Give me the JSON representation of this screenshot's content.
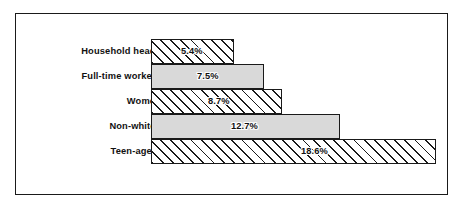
{
  "chart_data": {
    "type": "bar",
    "orientation": "horizontal",
    "title": "",
    "subtitle": "",
    "xlabel": "",
    "ylabel": "",
    "grid": false,
    "legend": null,
    "axis_visible": false,
    "value_suffix": "%",
    "xlim": [
      0,
      18.6
    ],
    "categories": [
      "Household heads",
      "Full-time workers",
      "Women",
      "Non-whites",
      "Teen-agers"
    ],
    "values": [
      5.4,
      12.7,
      8.7,
      12.7,
      18.6
    ],
    "bars": [
      {
        "label": "Household heads",
        "value": 5.4,
        "value_label": "5.4%",
        "fill": "hatched",
        "bar_width_px": 83,
        "value_label_offset_px": 30
      },
      {
        "label": "Full-time workers",
        "value": 7.5,
        "value_label": "7.5%",
        "fill": "solid",
        "bar_width_px": 113,
        "value_label_offset_px": 46
      },
      {
        "label": "Women",
        "value": 8.7,
        "value_label": "8.7%",
        "fill": "hatched",
        "bar_width_px": 131,
        "value_label_offset_px": 57
      },
      {
        "label": "Non-whites",
        "value": 12.7,
        "value_label": "12.7%",
        "fill": "solid",
        "bar_width_px": 189,
        "value_label_offset_px": 80
      },
      {
        "label": "Teen-agers",
        "value": 18.6,
        "value_label": "18.6%",
        "fill": "hatched",
        "bar_width_px": 285,
        "value_label_offset_px": 150
      }
    ]
  },
  "style": {
    "frame_color": "#1a1a1a",
    "bar_outline_color": "#1a1a1a",
    "solid_fill_color": "#d9d9d9",
    "hatch_color": "#1a1a1a",
    "background_color": "#ffffff",
    "text_color": "#111111"
  }
}
